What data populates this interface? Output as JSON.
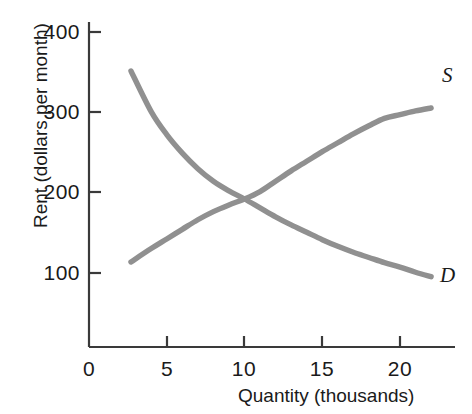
{
  "chart_data": {
    "type": "line",
    "title": "",
    "subtitle": "",
    "xlabel": "Quantity (thousands)",
    "ylabel": "Rent (dollars per month)",
    "xlim": [
      0,
      23.5
    ],
    "ylim": [
      0,
      430
    ],
    "xticks": [
      0,
      5,
      10,
      15,
      20
    ],
    "xtick_labels": [
      "0",
      "5",
      "10",
      "15",
      "20"
    ],
    "yticks": [
      100,
      200,
      300,
      400
    ],
    "ytick_labels": [
      "100",
      "200",
      "300",
      "400"
    ],
    "grid": false,
    "legend_position": "inline-end-of-curve",
    "curve_color": "#909090",
    "axis_color": "#3a3a3a",
    "text_color": "#1a1a1a",
    "background": "#ffffff",
    "equilibrium": {
      "x": 10,
      "y": 200
    },
    "series": [
      {
        "name": "D",
        "label": "D",
        "description": "Demand curve",
        "x": [
          2.7,
          4,
          5,
          6,
          7,
          8,
          9,
          10,
          11,
          12,
          13,
          14,
          15,
          16,
          17,
          18,
          19,
          20,
          21,
          22
        ],
        "values": [
          373,
          318,
          287,
          262,
          241,
          224,
          211,
          200,
          188,
          176,
          165,
          155,
          145,
          136,
          128,
          121,
          114,
          108,
          101,
          95
        ]
      },
      {
        "name": "S",
        "label": "S",
        "description": "Supply curve",
        "x": [
          2.7,
          4,
          5,
          6,
          7,
          8,
          9,
          10,
          11,
          12,
          13,
          14,
          15,
          16,
          17,
          18,
          19,
          20,
          21,
          22
        ],
        "values": [
          115,
          133,
          146,
          159,
          172,
          183,
          192,
          200,
          210,
          224,
          238,
          251,
          264,
          276,
          288,
          299,
          309,
          314,
          319,
          323
        ]
      }
    ]
  }
}
